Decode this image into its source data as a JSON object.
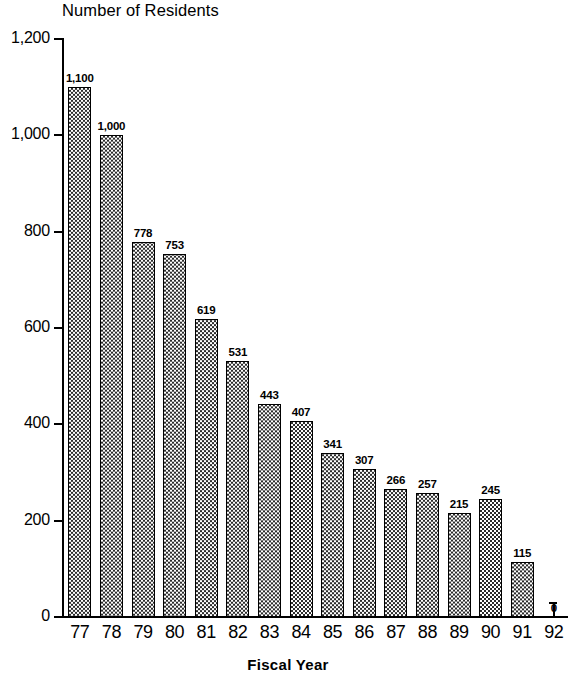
{
  "chart_data": {
    "type": "bar",
    "title": "Number of Residents",
    "xlabel": "Fiscal Year",
    "ylabel": "",
    "categories": [
      "77",
      "78",
      "79",
      "80",
      "81",
      "82",
      "83",
      "84",
      "85",
      "86",
      "87",
      "88",
      "89",
      "90",
      "91",
      "92"
    ],
    "values": [
      1100,
      1000,
      778,
      753,
      619,
      531,
      443,
      407,
      341,
      307,
      266,
      257,
      215,
      245,
      115,
      0
    ],
    "value_labels": [
      "1,100",
      "1,000",
      "778",
      "753",
      "619",
      "531",
      "443",
      "407",
      "341",
      "307",
      "266",
      "257",
      "215",
      "245",
      "115",
      "0"
    ],
    "ylim": [
      0,
      1200
    ],
    "y_ticks": [
      0,
      200,
      400,
      600,
      800,
      1000,
      1200
    ],
    "y_tick_labels": [
      "0",
      "200",
      "400",
      "600",
      "800",
      "1,000",
      "1,200"
    ],
    "grid": false,
    "legend": "none",
    "bar_fill": "checkered-halftone",
    "colors": {
      "background": "#ffffff",
      "ink": "#000000",
      "bar_fill": "#2b2b2b",
      "bar_border": "#000000"
    }
  }
}
